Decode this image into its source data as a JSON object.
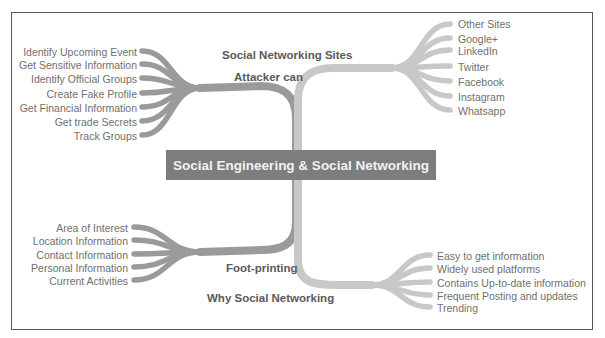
{
  "diagram": {
    "type": "mind-map",
    "center": {
      "label": "Social Engineering & Social Networking"
    },
    "colors": {
      "center_fill": "#7d7d7d",
      "center_text": "#f2f2f2",
      "branch_dark": "#9a9a9a",
      "branch_light": "#c8c8c8",
      "leaf_text": "#6f6f6f",
      "branch_label_text": "#5a5a5a",
      "frame": "#555555"
    },
    "branches": [
      {
        "id": "attacker-can",
        "label": "Attacker can",
        "side": "left",
        "position": "top",
        "leaves": [
          "Identify Upcoming Event",
          "Get Sensitive Information",
          "Identify Official Groups",
          "Create Fake Profile",
          "Get Financial Information",
          "Get trade Secrets",
          "Track Groups"
        ]
      },
      {
        "id": "social-networking-sites",
        "label": "Social Networking Sites",
        "side": "right",
        "position": "top",
        "leaves": [
          "Other Sites",
          "Google+",
          "LinkedIn",
          "Twitter",
          "Facebook",
          "Instagram",
          "Whatsapp"
        ]
      },
      {
        "id": "foot-printing",
        "label": "Foot-printing",
        "side": "left",
        "position": "bottom",
        "leaves": [
          "Area of Interest",
          "Location Information",
          "Contact Information",
          "Personal Information",
          "Current Activities"
        ]
      },
      {
        "id": "why-social-networking",
        "label": "Why Social Networking",
        "side": "right",
        "position": "bottom",
        "leaves": [
          "Easy to get information",
          "Widely used platforms",
          "Contains Up-to-date information",
          "Frequent Posting and updates",
          "Trending"
        ]
      }
    ]
  }
}
